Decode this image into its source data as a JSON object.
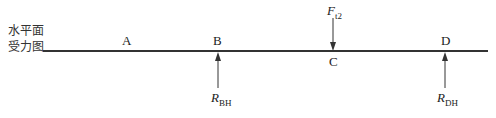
{
  "diagram": {
    "title_line1": "水平面",
    "title_line2": "受力图",
    "points": {
      "A": "A",
      "B": "B",
      "C": "C",
      "D": "D"
    },
    "forces": {
      "Ft2": {
        "main": "F",
        "sub": "t2"
      },
      "RBH": {
        "main": "R",
        "sub": "BH"
      },
      "RDH": {
        "main": "R",
        "sub": "DH"
      }
    }
  }
}
